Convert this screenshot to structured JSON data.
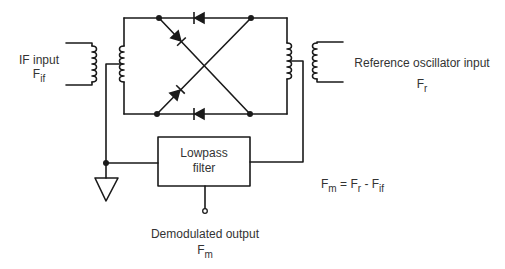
{
  "diagram": {
    "type": "balanced mixer / demodulator circuit",
    "colors": {
      "line": "#1a1a1a",
      "background": "#ffffff",
      "text": "#333333"
    },
    "labels": {
      "if_input": {
        "title": "IF input",
        "symbol": "F",
        "subscript": "if"
      },
      "reference_input": {
        "title": "Reference oscillator input",
        "symbol": "F",
        "subscript": "r"
      },
      "filter": {
        "line1": "Lowpass",
        "line2": "filter"
      },
      "output": {
        "title": "Demodulated output",
        "symbol": "F",
        "subscript": "m"
      },
      "equation": {
        "lhs_symbol": "F",
        "lhs_sub": "m",
        "eq": " = ",
        "t1_symbol": "F",
        "t1_sub": "r",
        "op": " - ",
        "t2_symbol": "F",
        "t2_sub": "if"
      }
    },
    "components": [
      {
        "name": "if-input-transformer",
        "kind": "transformer"
      },
      {
        "name": "diode-top",
        "kind": "diode",
        "direction": "left"
      },
      {
        "name": "diode-bottom",
        "kind": "diode",
        "direction": "left"
      },
      {
        "name": "diode-cross-1",
        "kind": "diode",
        "direction": "down-right"
      },
      {
        "name": "diode-cross-2",
        "kind": "diode",
        "direction": "up-right"
      },
      {
        "name": "reference-transformer",
        "kind": "transformer"
      },
      {
        "name": "lowpass-filter",
        "kind": "block"
      },
      {
        "name": "ground",
        "kind": "ground"
      },
      {
        "name": "output-terminal",
        "kind": "terminal"
      }
    ]
  }
}
